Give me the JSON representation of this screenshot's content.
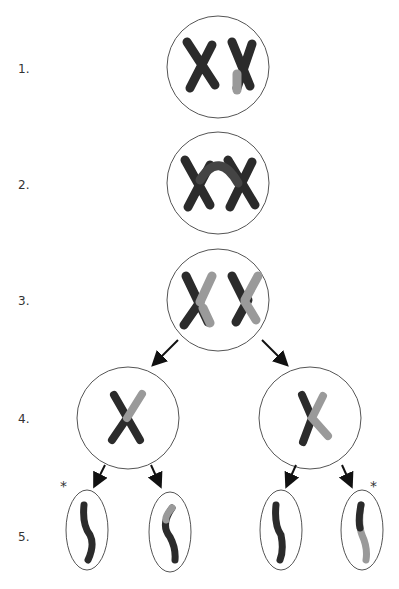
{
  "diagram": {
    "type": "meiosis-crossing-over",
    "stages": [
      {
        "label": "1.",
        "description": "homologous chromosomes, unpaired"
      },
      {
        "label": "2.",
        "description": "pairing with crossing over"
      },
      {
        "label": "3.",
        "description": "recombinant chromosomes"
      },
      {
        "label": "4.",
        "description": "separated chromosomes in two cells"
      },
      {
        "label": "5.",
        "description": "four chromatids in gametes"
      }
    ],
    "markers": {
      "asterisk": "*"
    },
    "colors": {
      "dark": "#2b2b2b",
      "light": "#9a9a9a",
      "outline": "#555555"
    }
  }
}
